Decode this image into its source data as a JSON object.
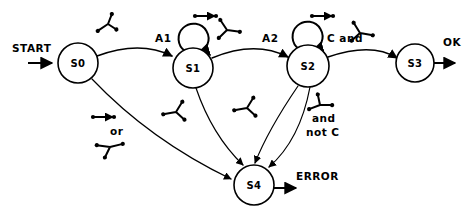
{
  "diagram": {
    "background_color": "#ffffff",
    "stroke_color": "#000000",
    "states": [
      {
        "id": "s0",
        "label": "S0",
        "cx": 78,
        "cy": 63,
        "r": 20
      },
      {
        "id": "s1",
        "label": "S1",
        "cx": 193,
        "cy": 68,
        "r": 20
      },
      {
        "id": "s2",
        "label": "S2",
        "cx": 308,
        "cy": 66,
        "r": 21
      },
      {
        "id": "s3",
        "label": "S3",
        "cx": 415,
        "cy": 63,
        "r": 19
      },
      {
        "id": "s4",
        "label": "S4",
        "cx": 254,
        "cy": 185,
        "r": 20
      }
    ],
    "self_loops": [
      {
        "id": "loop-s1",
        "on_state": "S1",
        "cx": 193,
        "cy": 40,
        "r": 15
      },
      {
        "id": "loop-s2",
        "on_state": "S2",
        "cx": 307,
        "cy": 38,
        "r": 15
      }
    ],
    "edge_labels": [
      {
        "id": "label-a1",
        "text": "A1",
        "x": 155,
        "y": 42
      },
      {
        "id": "label-a2",
        "text": "A2",
        "x": 262,
        "y": 42
      },
      {
        "id": "label-c-and",
        "text": "C and",
        "x": 327,
        "y": 42
      },
      {
        "id": "label-and",
        "text": "and",
        "x": 312,
        "y": 122
      },
      {
        "id": "label-not-c",
        "text": "not C",
        "x": 306,
        "y": 136
      },
      {
        "id": "label-or",
        "text": "or",
        "x": 110,
        "y": 135
      }
    ],
    "io_labels": [
      {
        "id": "label-start",
        "text": "START",
        "x": 12,
        "y": 52
      },
      {
        "id": "label-ok",
        "text": "OK",
        "x": 443,
        "y": 46
      },
      {
        "id": "label-error",
        "text": "ERROR",
        "x": 296,
        "y": 180
      }
    ],
    "transitions": [
      {
        "id": "t-start-s0",
        "from": "START",
        "to": "S0",
        "label": ""
      },
      {
        "id": "t-s0-s1",
        "from": "S0",
        "to": "S1",
        "label": "A1"
      },
      {
        "id": "t-s1-s2",
        "from": "S1",
        "to": "S2",
        "label": "A2"
      },
      {
        "id": "t-s2-s3",
        "from": "S2",
        "to": "S3",
        "label": "C and"
      },
      {
        "id": "t-s3-ok",
        "from": "S3",
        "to": "OK",
        "label": "OK"
      },
      {
        "id": "t-s0-s4",
        "from": "S0",
        "to": "S4",
        "label": "or"
      },
      {
        "id": "t-s1-s4",
        "from": "S1",
        "to": "S4",
        "label": ""
      },
      {
        "id": "t-s2-s4-a",
        "from": "S2",
        "to": "S4",
        "label": ""
      },
      {
        "id": "t-s2-s4-b",
        "from": "S2",
        "to": "S4",
        "label": "and not C"
      },
      {
        "id": "t-s4-error",
        "from": "S4",
        "to": "ERROR",
        "label": "ERROR"
      }
    ],
    "annotation_glyphs": [
      {
        "id": "glyph-y-above-s0",
        "type": "y-mark",
        "x": 108,
        "y": 24
      },
      {
        "id": "glyph-bar-s1",
        "type": "bar-mark",
        "x": 205,
        "y": 16
      },
      {
        "id": "glyph-y-s1-right",
        "type": "y-mark",
        "x": 227,
        "y": 30
      },
      {
        "id": "glyph-bar-s2",
        "type": "bar-mark",
        "x": 322,
        "y": 16
      },
      {
        "id": "glyph-y-c-and",
        "type": "y-mark",
        "x": 360,
        "y": 33
      },
      {
        "id": "glyph-y-s1-below",
        "type": "y-mark",
        "x": 176,
        "y": 112
      },
      {
        "id": "glyph-y-mid",
        "type": "y-mark",
        "x": 247,
        "y": 108
      },
      {
        "id": "glyph-y-notc",
        "type": "y-mark",
        "x": 320,
        "y": 105
      },
      {
        "id": "glyph-bar-or",
        "type": "bar-mark",
        "x": 103,
        "y": 117
      },
      {
        "id": "glyph-y-or",
        "type": "y-mark",
        "x": 110,
        "y": 147
      }
    ]
  }
}
